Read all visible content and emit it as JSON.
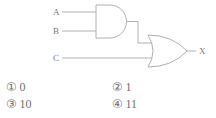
{
  "figure": {
    "type": "logic-circuit-diagram",
    "inputs": [
      {
        "label": "A",
        "target_gate": "and-gate",
        "pin": "top"
      },
      {
        "label": "B",
        "target_gate": "and-gate",
        "pin": "bottom"
      },
      {
        "label": "C",
        "target_gate": "or-gate",
        "pin": "bottom"
      }
    ],
    "gates": [
      {
        "name": "and-gate",
        "type": "AND",
        "inputs": [
          "A",
          "B"
        ]
      },
      {
        "name": "or-gate",
        "type": "OR",
        "inputs": [
          "and-gate",
          "C"
        ]
      }
    ],
    "output": {
      "label": "X",
      "source_gate": "or-gate"
    },
    "line_color": "#b0b0b0"
  },
  "options": [
    {
      "marker": "①",
      "value": "0"
    },
    {
      "marker": "②",
      "value": "1"
    },
    {
      "marker": "③",
      "value": "10"
    },
    {
      "marker": "④",
      "value": "11"
    }
  ]
}
